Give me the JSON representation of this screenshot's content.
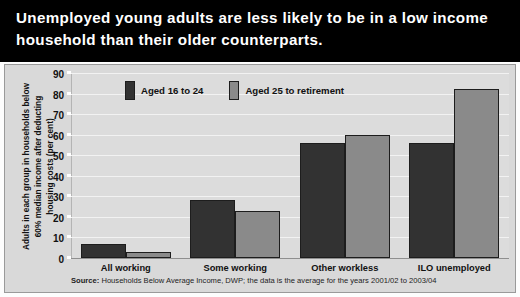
{
  "title": "Unemployed young adults are less likely to be in a low income household than their older counterparts.",
  "source": {
    "prefix": "Source:",
    "text": "Households Below Average Income, DWP; the data is the average for the years 2001/02 to 2003/04"
  },
  "colors": {
    "series_young": "#323232",
    "series_older": "#8a8a8a",
    "title_band": "#000000",
    "panel_background": "#d9d9d9",
    "plot_background": "#dcdcdc",
    "gridline": "#f2f2f2"
  },
  "chart_data": {
    "type": "bar",
    "title": "Unemployed young adults are less likely to be in a low income household than their older counterparts.",
    "xlabel": "",
    "ylabel": "Adults in each group in households below 60% median income after deducting housing costs (per cent)",
    "ylabel_lines": [
      "Adults in each group in households below",
      "60% median income after deducting",
      "housing costs (per cent)"
    ],
    "ylim": [
      0,
      90
    ],
    "yticks": [
      0,
      10,
      20,
      30,
      40,
      50,
      60,
      70,
      80,
      90
    ],
    "grid": true,
    "legend_position": "top-left",
    "categories": [
      "All working",
      "Some working",
      "Other workless",
      "ILO unemployed"
    ],
    "series": [
      {
        "name": "Aged 16 to 24",
        "color": "#323232",
        "values": [
          7,
          28,
          56,
          56
        ]
      },
      {
        "name": "Aged 25 to retirement",
        "color": "#8a8a8a",
        "values": [
          3,
          23,
          60,
          82
        ]
      }
    ],
    "annotations": [
      "Source: Households Below Average Income, DWP; the data is the average for the years 2001/02 to 2003/04"
    ]
  }
}
